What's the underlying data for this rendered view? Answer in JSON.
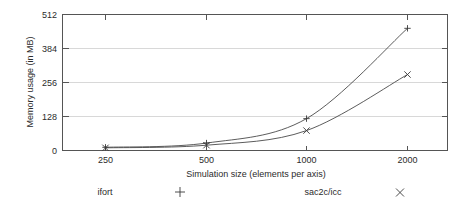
{
  "chart_data": {
    "type": "line",
    "title": "",
    "xlabel": "Simulation size (elements per axis)",
    "ylabel": "Memory usage (in MB)",
    "categories": [
      "250",
      "500",
      "1000",
      "2000"
    ],
    "x": [
      250,
      500,
      1000,
      2000
    ],
    "xscale": "categorical",
    "xtick_labels": [
      "250",
      "500",
      "1000",
      "2000"
    ],
    "ytick_labels": [
      "0",
      "128",
      "256",
      "384",
      "512"
    ],
    "yticks": [
      0,
      128,
      256,
      384,
      512
    ],
    "ylim": [
      0,
      512
    ],
    "grid": "horizontal",
    "legend_position": "below-plot",
    "series": [
      {
        "name": "ifort",
        "marker": "+",
        "values": [
          12,
          28,
          120,
          460
        ]
      },
      {
        "name": "sac2c/icc",
        "marker": "x",
        "values": [
          10,
          20,
          75,
          286
        ]
      }
    ]
  },
  "axes": {
    "y_title": "Memory usage (in MB)",
    "x_title": "Simulation size (elements per axis)",
    "y_ticks": [
      {
        "label": "512",
        "value": 512
      },
      {
        "label": "384",
        "value": 384
      },
      {
        "label": "256",
        "value": 256
      },
      {
        "label": "128",
        "value": 128
      },
      {
        "label": "0",
        "value": 0
      }
    ],
    "x_ticks": [
      {
        "label": "250",
        "value": 250
      },
      {
        "label": "500",
        "value": 500
      },
      {
        "label": "1000",
        "value": 1000
      },
      {
        "label": "2000",
        "value": 2000
      }
    ]
  },
  "legend": {
    "entries": [
      {
        "label": "ifort",
        "marker": "+"
      },
      {
        "label": "sac2c/icc",
        "marker": "×"
      }
    ]
  },
  "colors": {
    "background": "#ffffff",
    "frame": "#555555",
    "grid": "#d8d8d8",
    "line": "#4a4a4a",
    "text": "#2b2b2b"
  }
}
